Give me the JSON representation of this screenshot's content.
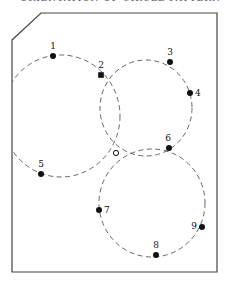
{
  "header": {
    "cut_off_title": "ORIENTATION OF CIRCLE PATTERNS"
  },
  "diagram": {
    "frame": {
      "stroke": "#444444",
      "points": [
        [
          12,
          40
        ],
        [
          41,
          13
        ],
        [
          217,
          13
        ],
        [
          217,
          272
        ],
        [
          12,
          272
        ]
      ]
    },
    "circles": [
      {
        "id": "left",
        "cx": 61,
        "cy": 116,
        "rx": 59,
        "ry": 61
      },
      {
        "id": "top-right",
        "cx": 146,
        "cy": 108,
        "rx": 46,
        "ry": 48
      },
      {
        "id": "bottom",
        "cx": 152,
        "cy": 203,
        "rx": 53,
        "ry": 54
      }
    ],
    "points": [
      {
        "label": "1",
        "x": 53,
        "y": 56,
        "lx": 53,
        "ly": 49,
        "anchor": "middle",
        "shape": "dot"
      },
      {
        "label": "2",
        "x": 101,
        "y": 75,
        "lx": 101,
        "ly": 68,
        "anchor": "middle",
        "shape": "square"
      },
      {
        "label": "3",
        "x": 170,
        "y": 62,
        "lx": 170,
        "ly": 55,
        "anchor": "middle",
        "shape": "dot"
      },
      {
        "label": "4",
        "x": 190,
        "y": 93,
        "lx": 195,
        "ly": 96,
        "anchor": "start",
        "shape": "dot"
      },
      {
        "label": "5",
        "x": 41,
        "y": 174,
        "lx": 41,
        "ly": 167,
        "anchor": "middle",
        "shape": "dot"
      },
      {
        "label": "6",
        "x": 169,
        "y": 148,
        "lx": 168,
        "ly": 141,
        "anchor": "middle",
        "shape": "dot"
      },
      {
        "label": "7",
        "x": 99,
        "y": 210,
        "lx": 104,
        "ly": 213,
        "anchor": "start",
        "shape": "dot"
      },
      {
        "label": "8",
        "x": 156,
        "y": 255,
        "lx": 156,
        "ly": 248,
        "anchor": "middle",
        "shape": "dot"
      },
      {
        "label": "9",
        "x": 202,
        "y": 227,
        "lx": 197,
        "ly": 229,
        "anchor": "end",
        "shape": "dot"
      }
    ],
    "intersection": {
      "x": 116,
      "y": 153,
      "shape": "open-circle"
    },
    "colors": {
      "line": "#333333",
      "dot": "#111111",
      "dash": "#555555"
    }
  }
}
